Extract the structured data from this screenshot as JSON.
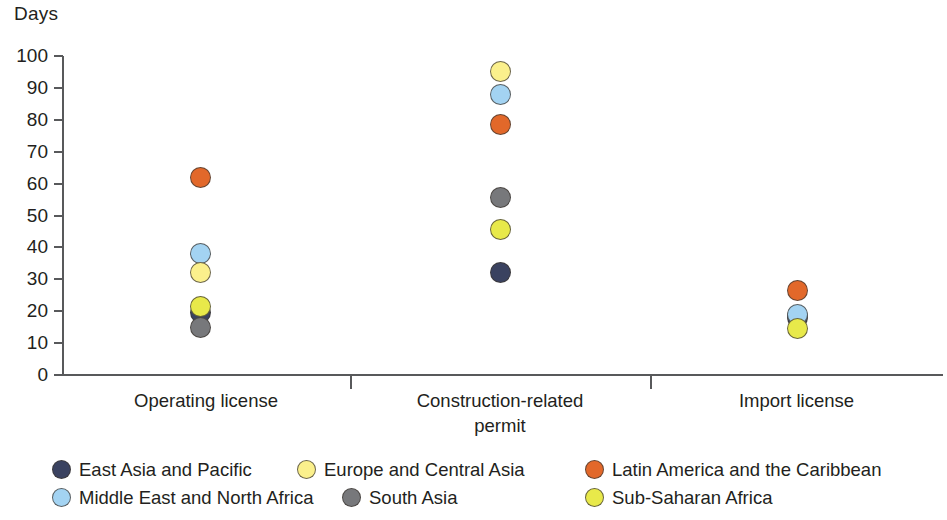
{
  "chart_data": {
    "type": "scatter",
    "title": "",
    "subtitle": "",
    "xlabel": "",
    "ylabel": "Days",
    "ylim": [
      0,
      100
    ],
    "ytick_step": 10,
    "yticks": [
      100,
      90,
      80,
      70,
      60,
      50,
      40,
      30,
      20,
      10,
      0
    ],
    "ytick_labels": [
      "100",
      "90",
      "80",
      "70",
      "60",
      "50",
      "40",
      "30",
      "20",
      "10",
      "0"
    ],
    "grid": false,
    "legend_position": "bottom-left",
    "categories": [
      "Operating license",
      "Construction-related permit",
      "Import license"
    ],
    "category_labels_wrapped": [
      [
        "Operating license"
      ],
      [
        "Construction-related",
        "permit"
      ],
      [
        "Import license"
      ]
    ],
    "series": [
      {
        "name": "East Asia and Pacific",
        "color": "#3a4260",
        "values": [
          19.5,
          32,
          18
        ]
      },
      {
        "name": "Europe and Central Asia",
        "color": "#fbf08c",
        "values": [
          32,
          95,
          null
        ]
      },
      {
        "name": "Latin America and the Caribbean",
        "color": "#e2682a",
        "values": [
          62,
          78.5,
          26.5
        ]
      },
      {
        "name": "Middle East and North Africa",
        "color": "#a3d3f2",
        "values": [
          38,
          88,
          19
        ]
      },
      {
        "name": "South Asia",
        "color": "#77787b",
        "values": [
          15,
          55.5,
          18.5
        ]
      },
      {
        "name": "Sub-Saharan Africa",
        "color": "#e8e94a",
        "values": [
          21.5,
          45.5,
          14.5
        ]
      }
    ]
  },
  "axis": {
    "unit_label": "Days"
  },
  "legend": {
    "rows": [
      [
        {
          "label": "East Asia and Pacific",
          "color": "#3a4260"
        },
        {
          "label": "Europe and Central Asia",
          "color": "#fbf08c"
        },
        {
          "label": "Latin America and the Caribbean",
          "color": "#e2682a"
        }
      ],
      [
        {
          "label": "Middle East and North Africa",
          "color": "#a3d3f2"
        },
        {
          "label": "South Asia",
          "color": "#77787b"
        },
        {
          "label": "Sub-Saharan Africa",
          "color": "#e8e94a"
        }
      ]
    ]
  }
}
